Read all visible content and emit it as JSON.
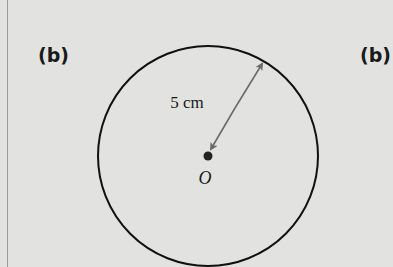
{
  "labels": {
    "left": "(b)",
    "right": "(b)"
  },
  "circle": {
    "center_label": "O",
    "radius_label": "5 cm",
    "cx": 208,
    "cy": 155,
    "r": 111
  },
  "colors": {
    "background": "#e2e2e0",
    "stroke": "#111111",
    "arrow": "#666666",
    "dot": "#222222"
  }
}
